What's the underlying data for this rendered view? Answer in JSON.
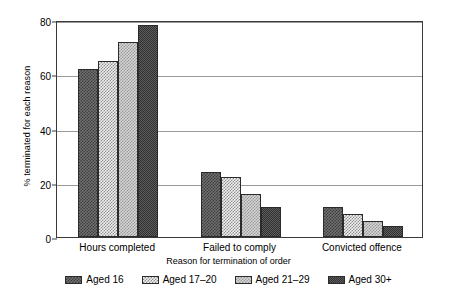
{
  "chart_data": {
    "type": "bar",
    "title": "",
    "xlabel": "Reason for termination of order",
    "ylabel": "% terminated for each reason",
    "categories": [
      "Hours completed",
      "Failed to comply",
      "Convicted offence"
    ],
    "series": [
      {
        "name": "Aged 16",
        "values": [
          62,
          24,
          11
        ]
      },
      {
        "name": "Aged 17–20",
        "values": [
          65,
          22,
          8.5
        ]
      },
      {
        "name": "Aged 21–29",
        "values": [
          72,
          16,
          6
        ]
      },
      {
        "name": "Aged 30+",
        "values": [
          78,
          11,
          4
        ]
      }
    ],
    "ylim": [
      0,
      80
    ],
    "yticks": [
      0,
      20,
      40,
      60,
      80
    ],
    "ytick_labels": [
      "0",
      "20",
      "40",
      "60",
      "80"
    ],
    "grid": true,
    "legend_position": "bottom",
    "series_colors": [
      "#6f6f6f",
      "#f0f0f0",
      "#d3d3d3",
      "#5f5f5f"
    ]
  }
}
